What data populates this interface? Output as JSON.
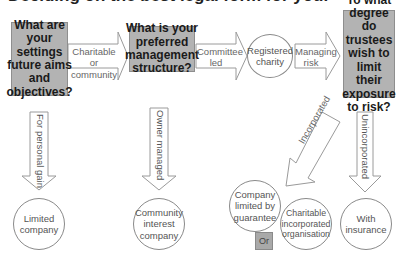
{
  "title": "Deciding on the best legal form for your",
  "questions": [
    {
      "id": "q1",
      "text": "What are your settings future aims and objectives?"
    },
    {
      "id": "q2",
      "text": "What is your preferred management structure?"
    },
    {
      "id": "q3",
      "text": "To what degree do trustees wish to limit their exposure to risk?"
    }
  ],
  "horizontal_arrows": [
    {
      "id": "a1",
      "label": "Charitable or community"
    },
    {
      "id": "a2",
      "label": "Committee led"
    },
    {
      "id": "a3",
      "label": "Managing risk"
    }
  ],
  "vertical_arrows": [
    {
      "id": "v1",
      "label": "For personal gain"
    },
    {
      "id": "v2",
      "label": "Owner managed"
    },
    {
      "id": "v3",
      "label": "Incorporated"
    },
    {
      "id": "v4",
      "label": "Unincorporated"
    }
  ],
  "outcomes": [
    {
      "id": "o-registered",
      "text": "Registered charity"
    },
    {
      "id": "o-limited",
      "text": "Limited company"
    },
    {
      "id": "o-cic",
      "text": "Community interest company"
    },
    {
      "id": "o-clg",
      "text": "Company limited by guarantee"
    },
    {
      "id": "o-cio",
      "text": "Charitable incorporated organisation"
    },
    {
      "id": "o-insurance",
      "text": "With insurance"
    }
  ],
  "or_label": "Or",
  "colors": {
    "question_fill": "#b3b3b3",
    "stroke": "#8a8a8a",
    "text_muted": "#666666"
  }
}
